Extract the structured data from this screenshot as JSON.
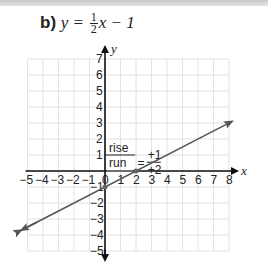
{
  "header": {
    "part_label": "b)",
    "equation_lhs": "y =",
    "fraction_num": "1",
    "fraction_den": "2",
    "equation_rhs": "x − 1"
  },
  "chart_data": {
    "type": "line",
    "xlabel": "x",
    "ylabel": "y",
    "xlim": [
      -5,
      8
    ],
    "ylim": [
      -5,
      7
    ],
    "grid": true,
    "x_ticks": [
      -5,
      -4,
      -3,
      -2,
      -1,
      0,
      1,
      2,
      3,
      4,
      5,
      6,
      7,
      8
    ],
    "y_ticks": [
      -5,
      -4,
      -3,
      -2,
      -1,
      1,
      2,
      3,
      4,
      5,
      6,
      7
    ],
    "series": [
      {
        "name": "y = 1/2 x - 1",
        "slope": 0.5,
        "intercept": -1,
        "x": [
          -5.4,
          8.2
        ],
        "values": [
          -3.7,
          3.1
        ],
        "color": "#555555"
      }
    ],
    "points": [
      {
        "x": 0,
        "y": -1,
        "label": "y-intercept"
      },
      {
        "x": 2,
        "y": 0,
        "label": "x-intercept"
      }
    ],
    "annotations": {
      "rise_label": "rise",
      "run_label": "run",
      "equals": "=",
      "rise_value": "+1",
      "run_value": "+2"
    }
  }
}
